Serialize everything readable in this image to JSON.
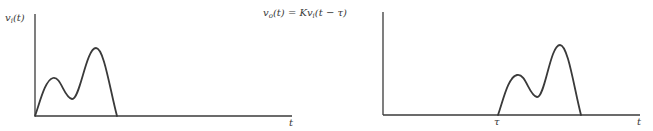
{
  "diagram": {
    "left_plot": {
      "y_label": {
        "main": "v",
        "sub": "i",
        "arg": "(t)"
      },
      "x_label": "t"
    },
    "right_plot": {
      "y_label": {
        "lhs_main": "v",
        "lhs_sub": "o",
        "lhs_arg": "(t) = Kv",
        "rhs_sub": "i",
        "rhs_arg": "(t − τ)"
      },
      "x_label": "t",
      "delay_label": "τ"
    },
    "colors": {
      "ink": "#3a3a3a",
      "background": "#ffffff"
    }
  }
}
